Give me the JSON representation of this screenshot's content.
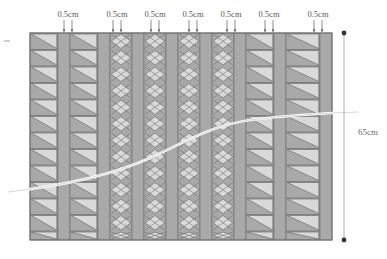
{
  "diagram": {
    "colors": {
      "background": "#ffffff",
      "band_dark": "#a9a9a9",
      "band_light": "#d9d9d9",
      "stroke": "#6f6f6f",
      "curve": "#ffffff",
      "dimension_line": "#9a9a9a",
      "label_text": "#5a5a5a"
    },
    "width_labels": [
      {
        "text": "0.5cm",
        "x": 68
      },
      {
        "text": "0.5cm",
        "x": 117
      },
      {
        "text": "0.5cm",
        "x": 155
      },
      {
        "text": "0.5cm",
        "x": 193
      },
      {
        "text": "0.5cm",
        "x": 231
      },
      {
        "text": "0.5cm",
        "x": 269
      },
      {
        "text": "0.5cm",
        "x": 318
      }
    ],
    "height_label": {
      "text": "65cm",
      "x": 358,
      "y": 135
    },
    "grid": {
      "left": 30,
      "right": 332,
      "top": 33,
      "bottom": 240,
      "row_height": 16.5,
      "rows": 13
    },
    "columns": [
      {
        "name": "col-hatch-1",
        "x": 30,
        "w": 28,
        "pattern": "diagonal"
      },
      {
        "name": "col-plain-1",
        "x": 58,
        "w": 12,
        "pattern": "plain"
      },
      {
        "name": "col-hatch-2",
        "x": 70,
        "w": 28,
        "pattern": "diagonal"
      },
      {
        "name": "col-plain-2",
        "x": 98,
        "w": 12,
        "pattern": "plain"
      },
      {
        "name": "col-hatch-3",
        "x": 110,
        "w": 22,
        "pattern": "cross"
      },
      {
        "name": "col-plain-3",
        "x": 132,
        "w": 12,
        "pattern": "plain"
      },
      {
        "name": "col-hatch-4",
        "x": 144,
        "w": 22,
        "pattern": "cross"
      },
      {
        "name": "col-plain-4",
        "x": 166,
        "w": 12,
        "pattern": "plain"
      },
      {
        "name": "col-hatch-5",
        "x": 178,
        "w": 22,
        "pattern": "cross"
      },
      {
        "name": "col-plain-5",
        "x": 200,
        "w": 12,
        "pattern": "plain"
      },
      {
        "name": "col-hatch-6",
        "x": 212,
        "w": 22,
        "pattern": "cross"
      },
      {
        "name": "col-plain-6",
        "x": 234,
        "w": 12,
        "pattern": "plain"
      },
      {
        "name": "col-hatch-7",
        "x": 246,
        "w": 28,
        "pattern": "diagonal"
      },
      {
        "name": "col-plain-7",
        "x": 274,
        "w": 12,
        "pattern": "plain"
      },
      {
        "name": "col-hatch-8",
        "x": 286,
        "w": 34,
        "pattern": "diagonal"
      },
      {
        "name": "col-plain-8",
        "x": 320,
        "w": 12,
        "pattern": "plain"
      }
    ],
    "arrow_targets": [
      64,
      72,
      113,
      121,
      151,
      159,
      189,
      197,
      227,
      235,
      265,
      273,
      314,
      322
    ],
    "curve": {
      "description": "white S-curve rising left to right",
      "path": "M 8,192 C 60,186 110,176 150,158 C 185,142 210,126 250,120 C 290,115 330,113 358,112"
    },
    "dimension": {
      "x": 344,
      "top_y": 33,
      "bottom_y": 240
    },
    "left_tick": {
      "x": 4,
      "y": 41
    }
  }
}
